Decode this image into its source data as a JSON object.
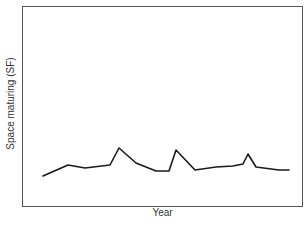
{
  "chart_data": {
    "type": "line",
    "title": "",
    "xlabel": "Year",
    "ylabel": "Space maturing (SF)",
    "x_ticks": [],
    "y_ticks": [],
    "grid": false,
    "legend": null,
    "note": "No tick labels or numeric scale shown; values are relative heights (0 = x-axis, 100 = top of frame), estimated from pixel positions.",
    "x": [
      1,
      2,
      3,
      4,
      5,
      6,
      7,
      8,
      9,
      10,
      11,
      12,
      13,
      14,
      15,
      16,
      17
    ],
    "series": [
      {
        "name": "Space maturing",
        "values": [
          15,
          20.5,
          19,
          20.5,
          29,
          21.5,
          17.5,
          17.5,
          28,
          18,
          19.5,
          20,
          21,
          26,
          19.5,
          18,
          18
        ]
      }
    ],
    "ylim": [
      0,
      100
    ]
  },
  "pixel_points": [
    [
      43,
      176
    ],
    [
      68,
      165
    ],
    [
      85,
      168
    ],
    [
      110,
      165
    ],
    [
      119,
      148
    ],
    [
      136,
      163
    ],
    [
      156,
      171
    ],
    [
      169,
      171
    ],
    [
      176,
      150
    ],
    [
      195,
      170
    ],
    [
      216,
      167
    ],
    [
      233,
      166
    ],
    [
      243,
      164
    ],
    [
      248,
      154
    ],
    [
      256,
      167
    ],
    [
      279,
      170
    ],
    [
      289,
      170
    ]
  ],
  "colors": {
    "line": "#1a1a1a",
    "frame": "#555555",
    "text": "#333333"
  }
}
